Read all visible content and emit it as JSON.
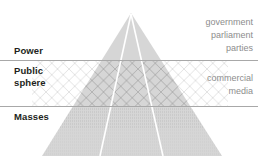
{
  "diagram": {
    "type": "pyramid",
    "tiers": [
      {
        "id": "power",
        "label": "Power",
        "actors": "government\nparliament\nparties",
        "fill": "#d6d6d6",
        "texture": "solid"
      },
      {
        "id": "public-sphere",
        "label": "Public\nsphere",
        "actors": "commercial\nmedia",
        "fill": "#d6d6d6",
        "texture": "crosshatch"
      },
      {
        "id": "masses",
        "label": "Masses",
        "actors": "",
        "fill": "#d6d6d6",
        "texture": "stipple"
      }
    ],
    "colors": {
      "pyramid_fill": "#d6d6d6",
      "divider": "#a8a8a8",
      "tier_label_text": "#231f20",
      "actor_label_text": "#8d8d8d",
      "inner_line": "#ffffff",
      "hatch": "#b4b4b4",
      "background": "#ffffff"
    },
    "geometry": {
      "apex_x": 131,
      "apex_y": 13,
      "base_left_x": 42,
      "base_right_x": 222,
      "base_y": 156,
      "divider_top_y": 60,
      "divider_bottom_y": 106
    }
  }
}
